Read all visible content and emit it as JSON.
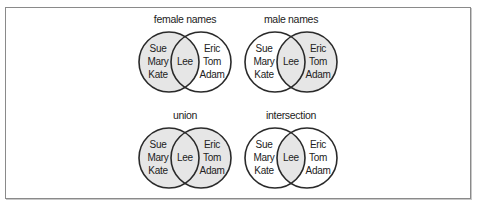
{
  "diagram": {
    "colors": {
      "shade": "#e6e6e6",
      "stroke": "#2a2a2a",
      "border": "#8a8a8a",
      "background": "#ffffff"
    },
    "sets": {
      "left_only": [
        "Sue",
        "Mary",
        "Kate"
      ],
      "both": [
        "Lee"
      ],
      "right_only": [
        "Eric",
        "Tom",
        "Adam"
      ]
    },
    "panels": [
      {
        "title": "female names",
        "shaded": [
          "left_only",
          "both"
        ],
        "left_labels": [
          "Sue",
          "Mary",
          "Kate"
        ],
        "middle_label": "Lee",
        "right_labels": [
          "Eric",
          "Tom",
          "Adam"
        ]
      },
      {
        "title": "male names",
        "shaded": [
          "both",
          "right_only"
        ],
        "left_labels": [
          "Sue",
          "Mary",
          "Kate"
        ],
        "middle_label": "Lee",
        "right_labels": [
          "Eric",
          "Tom",
          "Adam"
        ]
      },
      {
        "title": "union",
        "shaded": [
          "left_only",
          "both",
          "right_only"
        ],
        "left_labels": [
          "Sue",
          "Mary",
          "Kate"
        ],
        "middle_label": "Lee",
        "right_labels": [
          "Eric",
          "Tom",
          "Adam"
        ]
      },
      {
        "title": "intersection",
        "shaded": [
          "both"
        ],
        "left_labels": [
          "Sue",
          "Mary",
          "Kate"
        ],
        "middle_label": "Lee",
        "right_labels": [
          "Eric",
          "Tom",
          "Adam"
        ]
      }
    ]
  }
}
